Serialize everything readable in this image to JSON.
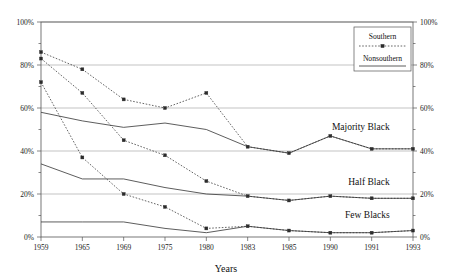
{
  "chart_data": {
    "type": "line",
    "title": "",
    "xlabel": "Years",
    "ylabel": "",
    "categories": [
      "1959",
      "1965",
      "1969",
      "1975",
      "1980",
      "1983",
      "1985",
      "1990",
      "1991",
      "1993"
    ],
    "ylim": [
      0,
      100
    ],
    "ytick_labels": [
      "0%",
      "20%",
      "40%",
      "60%",
      "80%",
      "100%"
    ],
    "ytick_values": [
      0,
      20,
      40,
      60,
      80,
      100
    ],
    "y_minor_step": 10,
    "grid": true,
    "grid_axis": "y",
    "legend_position": "top-right",
    "y_axis_both_sides": true,
    "legend": [
      {
        "name": "Southern",
        "style": "dotted-with-markers"
      },
      {
        "name": "Nonsouthern",
        "style": "solid"
      }
    ],
    "series": [
      {
        "name": "Majority Black - Southern",
        "group": "Majority Black",
        "region": "Southern",
        "style": "dotted-with-markers",
        "values": [
          86,
          78,
          64,
          60,
          67,
          42,
          39,
          47,
          41,
          41
        ]
      },
      {
        "name": "Majority Black - Nonsouthern",
        "group": "Majority Black",
        "region": "Nonsouthern",
        "style": "solid",
        "values": [
          58,
          54,
          51,
          53,
          50,
          42,
          39,
          47,
          41,
          41
        ]
      },
      {
        "name": "Half Black - Southern",
        "group": "Half Black",
        "region": "Southern",
        "style": "dotted-with-markers",
        "values": [
          83,
          67,
          45,
          38,
          26,
          19,
          17,
          19,
          18,
          18
        ]
      },
      {
        "name": "Half Black - Nonsouthern",
        "group": "Half Black",
        "region": "Nonsouthern",
        "style": "solid",
        "values": [
          34,
          27,
          27,
          23,
          20,
          19,
          17,
          19,
          18,
          18
        ]
      },
      {
        "name": "Few Blacks - Southern",
        "group": "Few Blacks",
        "region": "Southern",
        "style": "dotted-with-markers",
        "values": [
          72,
          37,
          20,
          14,
          4,
          5,
          3,
          2,
          2,
          3
        ]
      },
      {
        "name": "Few Blacks - Nonsouthern",
        "group": "Few Blacks",
        "region": "Nonsouthern",
        "style": "solid",
        "values": [
          7,
          7,
          7,
          4,
          2,
          5,
          3,
          2,
          2,
          3
        ]
      }
    ],
    "annotations": [
      {
        "text": "Majority Black",
        "x_index": 8,
        "y_value": 50
      },
      {
        "text": "Half Black",
        "x_index": 8,
        "y_value": 24
      },
      {
        "text": "Few Blacks",
        "x_index": 8,
        "y_value": 9
      }
    ]
  },
  "axis": {
    "x_title": "Years",
    "x_ticks": [
      "1959",
      "1965",
      "1969",
      "1975",
      "1980",
      "1983",
      "1985",
      "1990",
      "1991",
      "1993"
    ],
    "y_ticks_left": [
      "100%",
      "80%",
      "60%",
      "40%",
      "20%",
      "0%"
    ],
    "y_ticks_right": [
      "100%",
      "80%",
      "60%",
      "40%",
      "20%",
      "0%"
    ]
  },
  "legend": {
    "southern_label": "Southern",
    "nonsouthern_label": "Nonsouthern"
  },
  "annotations": {
    "majority_black": "Majority Black",
    "half_black": "Half Black",
    "few_blacks": "Few Blacks"
  }
}
